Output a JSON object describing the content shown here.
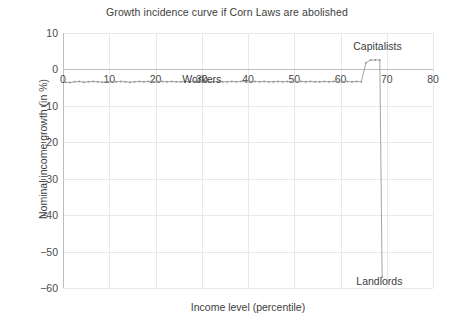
{
  "chart_data": {
    "type": "line",
    "title": "Growth incidence curve if Corn Laws are abolished",
    "xlabel": "Income level (percentile)",
    "ylabel": "Nominal income growth (in %)",
    "xlim": [
      0,
      80
    ],
    "ylim": [
      -60,
      10
    ],
    "xticks": [
      0,
      10,
      20,
      30,
      40,
      50,
      60,
      70,
      80
    ],
    "xtick_labels": [
      "0",
      "10",
      "20",
      "30",
      "40",
      "50",
      "60",
      "70",
      "80"
    ],
    "yticks": [
      10,
      0,
      -10,
      -20,
      -30,
      -40,
      -50,
      -60
    ],
    "ytick_labels": [
      "10",
      "0",
      "−10",
      "−20",
      "−30",
      "−40",
      "−50",
      "−60"
    ],
    "grid": true,
    "legend": "none",
    "line_color": "#9a9a9a",
    "marker": "dot",
    "annotations": [
      {
        "label": "Workers",
        "x": 30,
        "y": -2.6
      },
      {
        "label": "Capitalists",
        "x": 68.0,
        "y": 6.4
      },
      {
        "label": "Landlords",
        "x": 68.4,
        "y": -58.0
      }
    ],
    "series": [
      {
        "name": "Growth incidence",
        "x": [
          0.5,
          1.5,
          2.5,
          3.5,
          4.5,
          5.5,
          6.5,
          7.5,
          8.5,
          9.5,
          10.5,
          11.5,
          12.5,
          13.5,
          14.5,
          15.5,
          16.5,
          17.5,
          18.5,
          19.5,
          20.5,
          21.5,
          22.5,
          23.5,
          24.5,
          25.5,
          26.5,
          27.5,
          28.5,
          29.5,
          30.5,
          31.5,
          32.5,
          33.5,
          34.5,
          35.5,
          36.5,
          37.5,
          38.5,
          39.5,
          40.5,
          41.5,
          42.5,
          43.5,
          44.5,
          45.5,
          46.5,
          47.5,
          48.5,
          49.5,
          50.5,
          51.5,
          52.5,
          53.5,
          54.5,
          55.5,
          56.5,
          57.5,
          58.5,
          59.5,
          60.5,
          61.5,
          62.5,
          63.5,
          64.5,
          65.5,
          66.5,
          67.5,
          68.5,
          69.0
        ],
        "y": [
          -3.5,
          -3.6,
          -3.4,
          -3.3,
          -3.5,
          -3.4,
          -3.3,
          -3.4,
          -3.5,
          -3.3,
          -3.4,
          -3.4,
          -3.3,
          -3.4,
          -3.5,
          -3.4,
          -3.3,
          -3.4,
          -3.3,
          -3.4,
          -3.4,
          -3.3,
          -3.4,
          -3.3,
          -3.4,
          -3.4,
          -3.3,
          -3.4,
          -3.3,
          -3.4,
          -3.4,
          -3.3,
          -3.4,
          -3.3,
          -3.4,
          -3.4,
          -3.3,
          -3.4,
          -3.3,
          -3.4,
          -3.4,
          -3.3,
          -3.4,
          -3.3,
          -3.4,
          -3.4,
          -3.3,
          -3.4,
          -3.3,
          -3.4,
          -3.4,
          -3.3,
          -3.4,
          -3.3,
          -3.4,
          -3.4,
          -3.3,
          -3.4,
          -3.3,
          -3.4,
          -3.4,
          -3.3,
          -3.4,
          -3.3,
          -3.4,
          1.8,
          2.6,
          2.6,
          2.6,
          -57.0
        ]
      }
    ]
  }
}
